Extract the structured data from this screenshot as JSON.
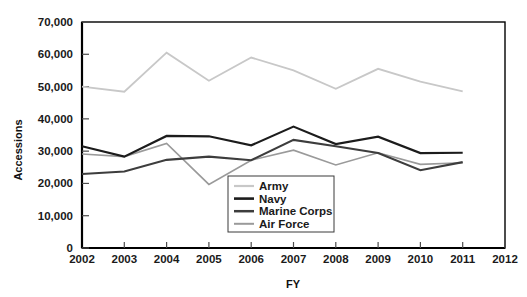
{
  "chart_data": {
    "type": "line",
    "title": "",
    "xlabel": "FY",
    "ylabel": "Accessions",
    "x": [
      2002,
      2003,
      2004,
      2005,
      2006,
      2007,
      2008,
      2009,
      2010,
      2011
    ],
    "xlim": [
      2002,
      2012
    ],
    "ylim": [
      0,
      70000
    ],
    "xticks": [
      2002,
      2003,
      2004,
      2005,
      2006,
      2007,
      2008,
      2009,
      2010,
      2011,
      2012
    ],
    "xtick_labels": [
      "2002",
      "2003",
      "2004",
      "2005",
      "2006",
      "2007",
      "2008",
      "2009",
      "2010",
      "2011",
      "2012"
    ],
    "yticks": [
      0,
      10000,
      20000,
      30000,
      40000,
      50000,
      60000,
      70000
    ],
    "ytick_labels": [
      "0",
      "10,000",
      "20,000",
      "30,000",
      "40,000",
      "50,000",
      "60,000",
      "70,000"
    ],
    "grid": false,
    "legend_position": "center",
    "series": [
      {
        "name": "Army",
        "color": "#c8c8c8",
        "width": 1.8,
        "values": [
          50000,
          48400,
          60500,
          51800,
          59000,
          55000,
          49300,
          55500,
          51500,
          48500
        ]
      },
      {
        "name": "Navy",
        "color": "#1c1c1c",
        "width": 2.2,
        "values": [
          31500,
          28300,
          34700,
          34600,
          31800,
          37600,
          32200,
          34500,
          29400,
          29500
        ]
      },
      {
        "name": "Marine Corps",
        "color": "#3d3d3d",
        "width": 2.1,
        "values": [
          22900,
          23700,
          27300,
          28300,
          27200,
          33500,
          31500,
          29400,
          24100,
          26600
        ]
      },
      {
        "name": "Air Force",
        "color": "#9a9a9a",
        "width": 1.6,
        "values": [
          29100,
          28300,
          32400,
          19700,
          27200,
          30300,
          25700,
          29500,
          25900,
          26400
        ]
      }
    ]
  },
  "legend": {
    "entries": [
      {
        "label": "Army"
      },
      {
        "label": "Navy"
      },
      {
        "label": "Marine Corps"
      },
      {
        "label": "Air Force"
      }
    ]
  },
  "axes": {
    "y_title": "Accessions",
    "x_title": "FY"
  }
}
